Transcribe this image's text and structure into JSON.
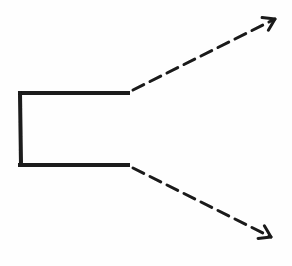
{
  "diagram": {
    "background": "#fefefe",
    "stroke_color": "#1a1a1a",
    "bracket": {
      "top": {
        "x1": 20,
        "y1": 93,
        "x2": 128,
        "y2": 93
      },
      "left": {
        "x1": 20,
        "y1": 93,
        "x2": 21,
        "y2": 165
      },
      "bottom": {
        "x1": 20,
        "y1": 165,
        "x2": 128,
        "y2": 165
      },
      "stroke_width": 4
    },
    "arrows": [
      {
        "name": "upper-dashed-arrow",
        "style": "dashed",
        "direction": "up-right",
        "x1": 133,
        "y1": 90,
        "x2": 275,
        "y2": 19
      },
      {
        "name": "lower-dashed-arrow",
        "style": "dashed",
        "direction": "down-right",
        "x1": 133,
        "y1": 168,
        "x2": 271,
        "y2": 237
      }
    ]
  }
}
